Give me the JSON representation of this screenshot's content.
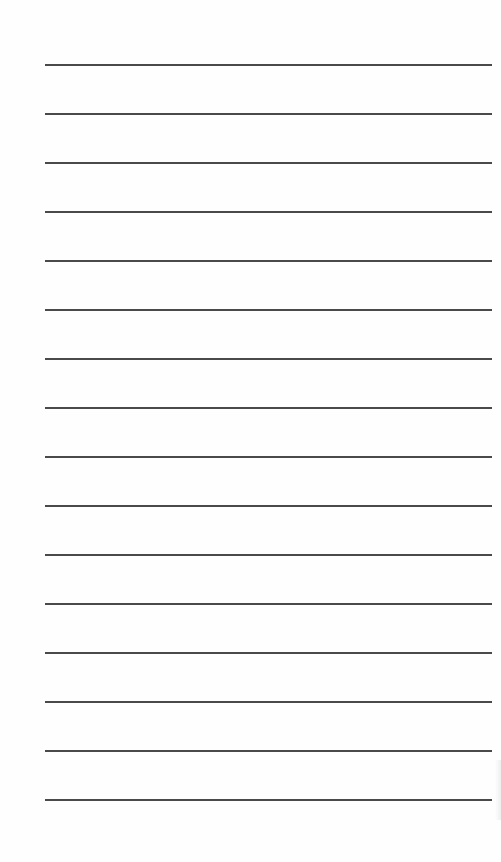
{
  "page": {
    "type": "lined-paper",
    "background_color": "#fefefe",
    "line_color": "#4a4a4a",
    "line_count": 16,
    "line_left_px": 45,
    "line_right_px": 492,
    "first_line_y_px": 64,
    "line_spacing_px": 49
  }
}
